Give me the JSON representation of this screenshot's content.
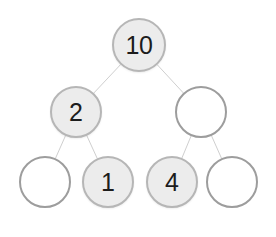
{
  "diagram": {
    "type": "binary-tree",
    "canvas": {
      "width": 276,
      "height": 237,
      "background": "#ffffff"
    },
    "style": {
      "filled_node_fill": "#ececec",
      "filled_node_stroke": "#b6b6b6",
      "empty_node_fill": "#ffffff",
      "empty_node_stroke": "#9d9d9d",
      "edge_color": "#cfcfcf",
      "edge_width": 1,
      "label_color": "#1c1c1c"
    },
    "nodes": [
      {
        "id": "root",
        "label": "10",
        "filled": true,
        "cx": 139,
        "cy": 45,
        "r": 27,
        "level": 0,
        "position": "root"
      },
      {
        "id": "n-l",
        "label": "2",
        "filled": true,
        "cx": 76,
        "cy": 112,
        "r": 26,
        "level": 1,
        "position": "left-child"
      },
      {
        "id": "n-r",
        "label": "",
        "filled": false,
        "cx": 201,
        "cy": 112,
        "r": 26,
        "level": 1,
        "position": "right-child"
      },
      {
        "id": "n-ll",
        "label": "",
        "filled": false,
        "cx": 45,
        "cy": 182,
        "r": 26,
        "level": 2,
        "position": "left-left"
      },
      {
        "id": "n-lr",
        "label": "1",
        "filled": true,
        "cx": 108,
        "cy": 182,
        "r": 26,
        "level": 2,
        "position": "left-right"
      },
      {
        "id": "n-rl",
        "label": "4",
        "filled": true,
        "cx": 172,
        "cy": 182,
        "r": 26,
        "level": 2,
        "position": "right-left"
      },
      {
        "id": "n-rr",
        "label": "",
        "filled": false,
        "cx": 232,
        "cy": 182,
        "r": 26,
        "level": 2,
        "position": "right-right"
      }
    ],
    "edges": [
      {
        "id": "e-root-l",
        "from": "root",
        "to": "n-l"
      },
      {
        "id": "e-root-r",
        "from": "root",
        "to": "n-r"
      },
      {
        "id": "e-l-ll",
        "from": "n-l",
        "to": "n-ll"
      },
      {
        "id": "e-l-lr",
        "from": "n-l",
        "to": "n-lr"
      },
      {
        "id": "e-r-rl",
        "from": "n-r",
        "to": "n-rl"
      },
      {
        "id": "e-r-rr",
        "from": "n-r",
        "to": "n-rr"
      }
    ]
  }
}
